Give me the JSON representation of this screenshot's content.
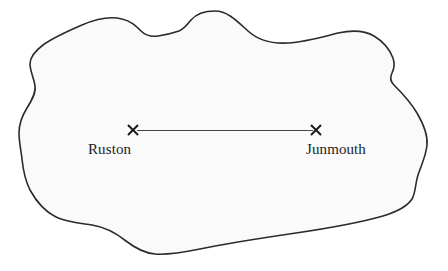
{
  "diagram": {
    "type": "region-outline-map",
    "background_color": "#ffffff",
    "landmass": {
      "name": "landmass-outline",
      "fill_color": "#fafafa",
      "stroke_color": "#2b2b2b",
      "stroke_width": 1.6
    },
    "route": {
      "name": "route-line",
      "stroke_color": "#454545",
      "stroke_width": 1.2,
      "from_x": 133,
      "from_y": 130,
      "to_x": 316,
      "to_y": 130
    },
    "markers": [
      {
        "id": "ruston",
        "glyph": "×",
        "x": 133,
        "y": 130,
        "color": "#1c1c1c",
        "label": "Ruston"
      },
      {
        "id": "junmouth",
        "glyph": "×",
        "x": 316,
        "y": 130,
        "color": "#1c1c1c",
        "label": "Junmouth"
      }
    ],
    "labels": {
      "left": "Ruston",
      "right": "Junmouth"
    }
  }
}
